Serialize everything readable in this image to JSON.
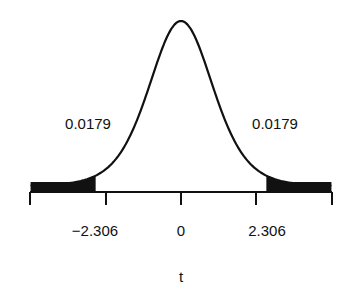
{
  "chart_data": {
    "type": "area",
    "title": "",
    "xlabel": "t",
    "ylabel": "",
    "distribution": "Student t density (symmetric, bell-shaped)",
    "x_ticks": [
      {
        "value": -4.6,
        "label": ""
      },
      {
        "value": -2.306,
        "label": "−2.306"
      },
      {
        "value": 0,
        "label": "0"
      },
      {
        "value": 2.306,
        "label": "2.306"
      },
      {
        "value": 4.6,
        "label": ""
      }
    ],
    "xlim": [
      -4.6,
      4.6
    ],
    "shaded_regions": [
      {
        "side": "left",
        "from": -4.6,
        "to": -2.61,
        "area": 0.0179,
        "label": "0.0179"
      },
      {
        "side": "right",
        "from": 2.61,
        "to": 4.6,
        "area": 0.0179,
        "label": "0.0179"
      }
    ],
    "annotations": [
      "0.0179",
      "0.0179"
    ],
    "grid": false,
    "legend": null
  },
  "labels": {
    "left_tail_area": "0.0179",
    "right_tail_area": "0.0179",
    "tick_neg": "−2.306",
    "tick_zero": "0",
    "tick_pos": "2.306",
    "x_axis": "t"
  },
  "colors": {
    "ink": "#111111",
    "background": "#ffffff"
  }
}
